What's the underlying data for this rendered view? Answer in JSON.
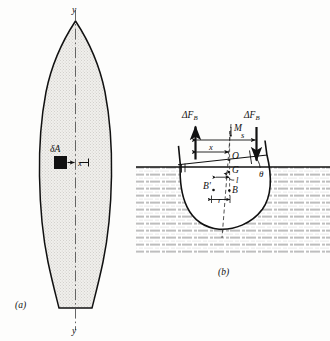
{
  "figure": {
    "title_a": "(a)",
    "title_b": "(b)",
    "panel_a": {
      "name": "waterplane-area-plan-view",
      "axis_label_top": "y",
      "axis_label_bottom": "y",
      "element_area_label": "δA",
      "moment_arm_label": "x",
      "description": "Ship waterplane plan view with centerline y-y, elemental area δA at distance x from centerline",
      "fill_color": "#e8e8e6",
      "outline_color": "#111111"
    },
    "panel_b": {
      "name": "heeled-hull-section",
      "force_left_label": "ΔF_B",
      "force_right_label": "ΔF_B",
      "metacenter_label": "M",
      "origin_label": "O",
      "center_of_gravity_label": "G",
      "center_of_buoyancy_label": "B",
      "shifted_buoyancy_label": "B'",
      "distance_l_label": "l",
      "distance_r_label": "r",
      "dimension_x_label": "x",
      "dimension_s_label": "s",
      "heel_angle_label": "θ",
      "description": "Transverse section of heeled hull showing buoyancy force couple, metacenter M, centers G, B, B'",
      "water_color": "#6d6d6d",
      "hull_fill": "#ffffff",
      "outline_color": "#111111"
    }
  }
}
